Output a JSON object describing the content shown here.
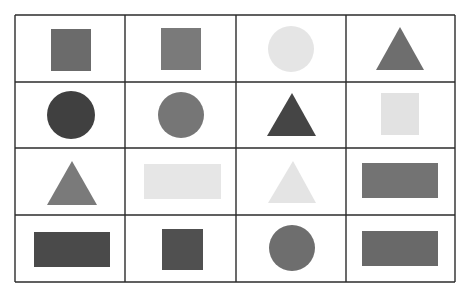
{
  "grid": {
    "rows": 4,
    "cols": 4,
    "x_lines": [
      15,
      125,
      236,
      346,
      455
    ],
    "y_lines": [
      15,
      82,
      148,
      215,
      282
    ],
    "line_color": "#2b2b2b",
    "background": "#ffffff"
  },
  "cells": [
    {
      "row": 0,
      "col": 0,
      "shape": "square",
      "color": "#6b6b6b",
      "x": 51,
      "y": 29,
      "w": 40,
      "h": 42
    },
    {
      "row": 0,
      "col": 1,
      "shape": "square",
      "color": "#7a7a7a",
      "x": 161,
      "y": 28,
      "w": 40,
      "h": 42
    },
    {
      "row": 0,
      "col": 2,
      "shape": "circle",
      "color": "#e5e5e5",
      "cx": 291,
      "cy": 49,
      "r": 23
    },
    {
      "row": 0,
      "col": 3,
      "shape": "triangle",
      "color": "#6e6e6e",
      "points": "400,27 376,70 424,70"
    },
    {
      "row": 1,
      "col": 0,
      "shape": "circle",
      "color": "#404040",
      "cx": 71,
      "cy": 115,
      "r": 24
    },
    {
      "row": 1,
      "col": 1,
      "shape": "circle",
      "color": "#767676",
      "cx": 181,
      "cy": 115,
      "r": 23
    },
    {
      "row": 1,
      "col": 2,
      "shape": "triangle",
      "color": "#454545",
      "points": "292,93 267,136 316,136"
    },
    {
      "row": 1,
      "col": 3,
      "shape": "square",
      "color": "#e2e2e2",
      "x": 381,
      "y": 93,
      "w": 38,
      "h": 42
    },
    {
      "row": 2,
      "col": 0,
      "shape": "triangle",
      "color": "#7a7a7a",
      "points": "72,161 47,205 97,205"
    },
    {
      "row": 2,
      "col": 1,
      "shape": "rectangle",
      "color": "#e6e6e6",
      "x": 144,
      "y": 164,
      "w": 77,
      "h": 35
    },
    {
      "row": 2,
      "col": 2,
      "shape": "triangle",
      "color": "#e4e4e4",
      "points": "293,161 268,203 316,203"
    },
    {
      "row": 2,
      "col": 3,
      "shape": "rectangle",
      "color": "#737373",
      "x": 362,
      "y": 163,
      "w": 76,
      "h": 35
    },
    {
      "row": 3,
      "col": 0,
      "shape": "rectangle",
      "color": "#4a4a4a",
      "x": 34,
      "y": 232,
      "w": 76,
      "h": 35
    },
    {
      "row": 3,
      "col": 1,
      "shape": "square",
      "color": "#505050",
      "x": 162,
      "y": 229,
      "w": 41,
      "h": 41
    },
    {
      "row": 3,
      "col": 2,
      "shape": "circle",
      "color": "#6e6e6e",
      "cx": 292,
      "cy": 248,
      "r": 23
    },
    {
      "row": 3,
      "col": 3,
      "shape": "rectangle",
      "color": "#696969",
      "x": 362,
      "y": 231,
      "w": 76,
      "h": 35
    }
  ]
}
